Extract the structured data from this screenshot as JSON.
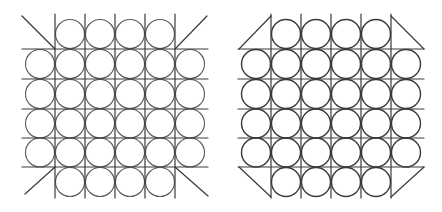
{
  "figures": [
    {
      "name": "left-figure",
      "grid": {
        "verticals_x": [
          55,
          85,
          115,
          145,
          175
        ],
        "vertical_span_y": [
          14,
          198
        ],
        "horizontals_y": [
          49,
          79,
          109,
          138,
          167
        ],
        "horizontal_span_x": [
          22,
          208
        ]
      },
      "circle_radius": 14.5,
      "rows": [
        {
          "cy": 34,
          "cx": [
            70,
            100,
            130,
            160
          ]
        },
        {
          "cy": 64,
          "cx": [
            40,
            70,
            100,
            130,
            160,
            190
          ]
        },
        {
          "cy": 94,
          "cx": [
            40,
            70,
            100,
            130,
            160,
            190
          ]
        },
        {
          "cy": 123.5,
          "cx": [
            40,
            70,
            100,
            130,
            160,
            190
          ]
        },
        {
          "cy": 152.5,
          "cx": [
            40,
            70,
            100,
            130,
            160,
            190
          ]
        },
        {
          "cy": 182,
          "cx": [
            70,
            100,
            130,
            160
          ]
        }
      ],
      "diagonals": [
        {
          "corner": "top-left",
          "x1": 22,
          "y1": 16,
          "x2": 55,
          "y2": 49
        },
        {
          "corner": "top-right",
          "x1": 175,
          "y1": 49,
          "x2": 207,
          "y2": 16
        },
        {
          "corner": "bottom-left",
          "x1": 25,
          "y1": 194,
          "x2": 55,
          "y2": 167
        },
        {
          "corner": "bottom-right",
          "x1": 175,
          "y1": 167,
          "x2": 208,
          "y2": 196
        }
      ]
    },
    {
      "name": "right-figure",
      "grid": {
        "verticals_x": [
          271,
          301,
          331,
          361,
          391
        ],
        "vertical_span_y": [
          14,
          198
        ],
        "horizontals_y": [
          49,
          79,
          109,
          138,
          167
        ],
        "horizontal_span_x": [
          238,
          424
        ]
      },
      "circle_radius": 14.5,
      "rows": [
        {
          "cy": 34,
          "cx": [
            286,
            316,
            346,
            376
          ]
        },
        {
          "cy": 64,
          "cx": [
            256,
            286,
            316,
            346,
            376,
            406
          ]
        },
        {
          "cy": 94,
          "cx": [
            256,
            286,
            316,
            346,
            376,
            406
          ]
        },
        {
          "cy": 123.5,
          "cx": [
            256,
            286,
            316,
            346,
            376,
            406
          ]
        },
        {
          "cy": 152.5,
          "cx": [
            256,
            286,
            316,
            346,
            376,
            406
          ]
        },
        {
          "cy": 182,
          "cx": [
            286,
            316,
            346,
            376
          ]
        }
      ],
      "diagonals": [
        {
          "corner": "top-left",
          "x1": 239,
          "y1": 49,
          "x2": 271,
          "y2": 16
        },
        {
          "corner": "top-right",
          "x1": 391,
          "y1": 16,
          "x2": 424,
          "y2": 49
        },
        {
          "corner": "bottom-left",
          "x1": 239,
          "y1": 167,
          "x2": 271,
          "y2": 197
        },
        {
          "corner": "bottom-right",
          "x1": 424,
          "y1": 167,
          "x2": 391,
          "y2": 197
        }
      ]
    }
  ],
  "colors": {
    "background": "#ffffff",
    "line": "#3a3a3a",
    "circle": "#5a5a5a"
  }
}
